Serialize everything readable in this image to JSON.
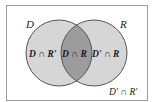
{
  "diagram": {
    "type": "venn",
    "sets": [
      {
        "name": "D",
        "label": "D"
      },
      {
        "name": "R",
        "label": "R"
      }
    ],
    "regions": {
      "d_only": "D ∩ R'",
      "intersection": "D ∩ R",
      "r_only": "D' ∩ R",
      "outside": "D' ∩ R'"
    },
    "colors": {
      "background": "#ffffff",
      "border": "#9a9a9a",
      "circle_fill": "#d6d6d6",
      "intersection_fill": "#9c9c9c",
      "circle_stroke": "#555555"
    }
  }
}
